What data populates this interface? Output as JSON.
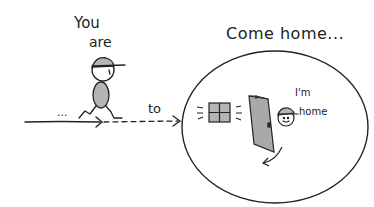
{
  "labels": {
    "you": "You",
    "are": "are",
    "to": "to",
    "come_home": "Come home...",
    "im": "I'm",
    "home": "home",
    "dots": "..."
  },
  "colors": {
    "ink": "#222222",
    "fill_gray": "#b5b5b5",
    "door_gray": "#a9a9a9",
    "background": "#ffffff"
  }
}
